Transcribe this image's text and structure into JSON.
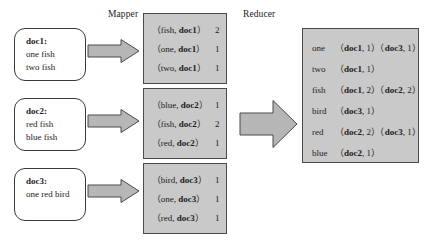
{
  "labels": {
    "mapper": "Mapper",
    "reducer": "Reducer"
  },
  "documents": [
    {
      "title": "doc1:",
      "lines": [
        "one fish",
        "two fish"
      ]
    },
    {
      "title": "doc2:",
      "lines": [
        "red fish",
        "blue fish"
      ]
    },
    {
      "title": "doc3:",
      "lines": [
        "one red bird"
      ]
    }
  ],
  "mapper_outputs": [
    {
      "rows": [
        {
          "open": "（",
          "word": "fish, ",
          "doc": "doc1",
          "close": "）",
          "count": "2"
        },
        {
          "open": "（",
          "word": "one, ",
          "doc": "doc1",
          "close": "）",
          "count": "1"
        },
        {
          "open": "（",
          "word": "two, ",
          "doc": "doc1",
          "close": "）",
          "count": "1"
        }
      ]
    },
    {
      "rows": [
        {
          "open": "（",
          "word": "blue, ",
          "doc": "doc2",
          "close": "）",
          "count": "1"
        },
        {
          "open": "（",
          "word": "fish, ",
          "doc": "doc2",
          "close": "）",
          "count": "2"
        },
        {
          "open": "（",
          "word": "red, ",
          "doc": "doc2",
          "close": "）",
          "count": "1"
        }
      ]
    },
    {
      "rows": [
        {
          "open": "（",
          "word": "bird, ",
          "doc": "doc3",
          "close": "）",
          "count": "1"
        },
        {
          "open": "（",
          "word": "one, ",
          "doc": "doc3",
          "close": "）",
          "count": "1"
        },
        {
          "open": "（",
          "word": "red, ",
          "doc": "doc3",
          "close": "）",
          "count": "1"
        }
      ]
    }
  ],
  "reducer_output": {
    "rows": [
      {
        "key": "one",
        "postings": [
          {
            "doc": "doc1",
            "count": "1"
          },
          {
            "doc": "doc3",
            "count": "1"
          }
        ]
      },
      {
        "key": "two",
        "postings": [
          {
            "doc": "doc1",
            "count": "1"
          }
        ]
      },
      {
        "key": "fish",
        "postings": [
          {
            "doc": "doc1",
            "count": "2"
          },
          {
            "doc": "doc2",
            "count": "2"
          }
        ]
      },
      {
        "key": "bird",
        "postings": [
          {
            "doc": "doc3",
            "count": "1"
          }
        ]
      },
      {
        "key": "red",
        "postings": [
          {
            "doc": "doc2",
            "count": "2"
          },
          {
            "doc": "doc3",
            "count": "1"
          }
        ]
      },
      {
        "key": "blue",
        "postings": [
          {
            "doc": "doc2",
            "count": "1"
          }
        ]
      }
    ]
  },
  "colors": {
    "gray_fill": "#c9c9c9",
    "arrow_fill": "#b6b6b6",
    "border": "#4a4a4a",
    "text": "#1b1b1b"
  }
}
